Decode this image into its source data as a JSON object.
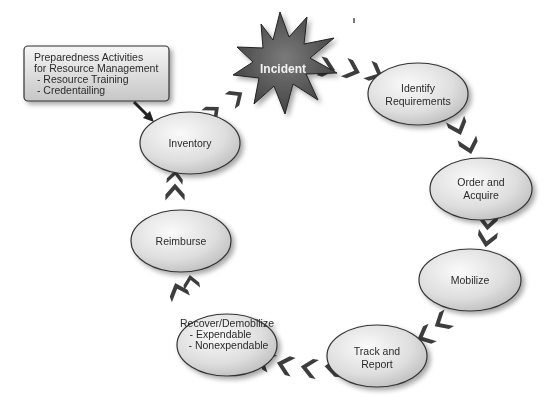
{
  "diagram": {
    "incident": {
      "label": "Incident"
    },
    "preparedness_box": {
      "lines": [
        "Preparedness Activities",
        "for Resource Management",
        " - Resource Training",
        " - Credentailing"
      ]
    },
    "nodes": [
      {
        "id": "identify",
        "lines": [
          "Identify",
          "Requirements"
        ]
      },
      {
        "id": "order",
        "lines": [
          "Order and",
          "Acquire"
        ]
      },
      {
        "id": "mobilize",
        "lines": [
          "Mobilize"
        ]
      },
      {
        "id": "track",
        "lines": [
          "Track and",
          "Report"
        ]
      },
      {
        "id": "recover",
        "lines": [
          "Recover/Demobilize",
          " - Expendable",
          " - Nonexpendable"
        ]
      },
      {
        "id": "reimburse",
        "lines": [
          "Reimburse"
        ]
      },
      {
        "id": "inventory",
        "lines": [
          "Inventory"
        ]
      }
    ],
    "colors": {
      "node_fill_light": "#f4f4f4",
      "node_fill_dark": "#bdbdbd",
      "node_stroke": "#333333",
      "chevron": "#3d3d3d",
      "incident_fill": "#555555",
      "box_fill_light": "#f2f2f2",
      "box_fill_dark": "#c9c9c9"
    }
  }
}
